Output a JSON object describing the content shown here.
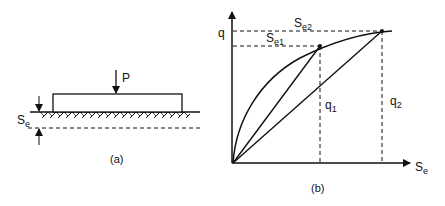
{
  "panel_a": {
    "load_label": "P",
    "settlement_label": "S",
    "settlement_sub": "e",
    "caption": "(a)"
  },
  "panel_b": {
    "y_axis_label": "q",
    "x_axis_label": "S",
    "x_axis_sub": "e",
    "se1_label": "S",
    "se1_sub": "e1",
    "se2_label": "S",
    "se2_sub": "e2",
    "q1_label": "q",
    "q1_sub": "1",
    "q2_label": "q",
    "q2_sub": "2",
    "caption": "(b)"
  },
  "colors": {
    "line": "#111111",
    "background": "#ffffff"
  }
}
